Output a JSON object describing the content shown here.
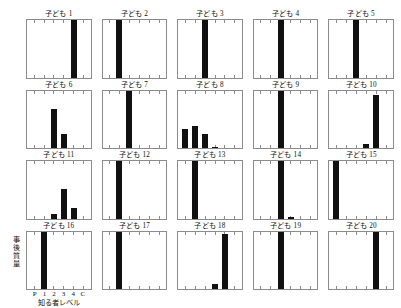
{
  "figure": {
    "axis": {
      "y_label": "事後質量",
      "y_label_chars": [
        "事",
        "後",
        "質",
        "量"
      ],
      "x_label": "知る者レベル",
      "x_tick_labels": [
        "P",
        "1",
        "2",
        "3",
        "4",
        "C"
      ]
    },
    "bar_color": "#111111",
    "frame_color": "#8c8c8c"
  },
  "chart_data": {
    "type": "bar",
    "title": "",
    "xlabel": "知る者レベル",
    "ylabel": "事後質量",
    "categories": [
      "P",
      "1",
      "2",
      "3",
      "4",
      "C"
    ],
    "ylim": [
      0,
      1
    ],
    "grid": false,
    "legend": false,
    "panel_layout": {
      "rows": 4,
      "cols": 5
    },
    "panels": [
      {
        "title": "子ども 1",
        "values": [
          0,
          0,
          0,
          0,
          1.0,
          0
        ]
      },
      {
        "title": "子ども 2",
        "values": [
          0,
          1.0,
          0,
          0,
          0,
          0
        ]
      },
      {
        "title": "子ども 3",
        "values": [
          0,
          0,
          1.0,
          0,
          0,
          0
        ]
      },
      {
        "title": "子ども 4",
        "values": [
          0,
          0,
          1.0,
          0,
          0,
          0
        ]
      },
      {
        "title": "子ども 5",
        "values": [
          0,
          0,
          1.0,
          0,
          0,
          0
        ]
      },
      {
        "title": "子ども 6",
        "values": [
          0,
          0,
          0.68,
          0.25,
          0,
          0
        ]
      },
      {
        "title": "子ども 7",
        "values": [
          0,
          0,
          1.0,
          0,
          0,
          0
        ]
      },
      {
        "title": "子ども 8",
        "values": [
          0.33,
          0.38,
          0.24,
          0.02,
          0,
          0
        ]
      },
      {
        "title": "子ども 9",
        "values": [
          0,
          0,
          1.0,
          0,
          0,
          0
        ]
      },
      {
        "title": "子ども 10",
        "values": [
          0,
          0,
          0,
          0.07,
          0.93,
          0
        ]
      },
      {
        "title": "子ども 11",
        "values": [
          0,
          0,
          0.07,
          0.52,
          0.18,
          0
        ]
      },
      {
        "title": "子ども 12",
        "values": [
          0,
          1.0,
          0,
          0,
          0,
          0
        ]
      },
      {
        "title": "子ども 13",
        "values": [
          0,
          1.0,
          0,
          0,
          0,
          0
        ]
      },
      {
        "title": "子ども 14",
        "values": [
          0,
          0,
          1.0,
          0.02,
          0,
          0
        ]
      },
      {
        "title": "子ども 15",
        "values": [
          1.0,
          0,
          0,
          0,
          0,
          0
        ]
      },
      {
        "title": "子ども 16",
        "values": [
          0,
          1.0,
          0,
          0,
          0,
          0
        ]
      },
      {
        "title": "子ども 17",
        "values": [
          0,
          1.0,
          0,
          0,
          0,
          0
        ]
      },
      {
        "title": "子ども 18",
        "values": [
          0,
          0,
          0,
          0.08,
          0.96,
          0
        ]
      },
      {
        "title": "子ども 19",
        "values": [
          0,
          0,
          1.0,
          0,
          0,
          0
        ]
      },
      {
        "title": "子ども 20",
        "values": [
          0,
          0,
          0,
          0,
          1.0,
          0
        ]
      }
    ]
  }
}
